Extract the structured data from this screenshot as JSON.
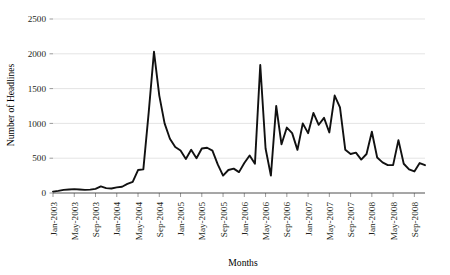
{
  "chart_data": {
    "type": "line",
    "title": "",
    "xlabel": "Months",
    "ylabel": "Number of Headlines",
    "ylim": [
      0,
      2500
    ],
    "yticks": [
      0,
      500,
      1000,
      1500,
      2000,
      2500
    ],
    "ytick_labels": [
      "0",
      "500",
      "1000",
      "1500",
      "2000",
      "2500"
    ],
    "grid": "horizontal",
    "legend": "none",
    "xtick_labels": [
      "Jan-2003",
      "May-2003",
      "Sep-2003",
      "Jan-2004",
      "May-2004",
      "Sep-2004",
      "Jan-2005",
      "May-2005",
      "Sep-2005",
      "Jan-2006",
      "May-2006",
      "Sep-2006",
      "Jan-2007",
      "May-2007",
      "Sep-2007",
      "Jan-2008",
      "May-2008",
      "Sep-2008"
    ],
    "xtick_interval_months": 4,
    "x": [
      "Jan-2003",
      "Feb-2003",
      "Mar-2003",
      "Apr-2003",
      "May-2003",
      "Jun-2003",
      "Jul-2003",
      "Aug-2003",
      "Sep-2003",
      "Oct-2003",
      "Nov-2003",
      "Dec-2003",
      "Jan-2004",
      "Feb-2004",
      "Mar-2004",
      "Apr-2004",
      "May-2004",
      "Jun-2004",
      "Jul-2004",
      "Aug-2004",
      "Sep-2004",
      "Oct-2004",
      "Nov-2004",
      "Dec-2004",
      "Jan-2005",
      "Feb-2005",
      "Mar-2005",
      "Apr-2005",
      "May-2005",
      "Jun-2005",
      "Jul-2005",
      "Aug-2005",
      "Sep-2005",
      "Oct-2005",
      "Nov-2005",
      "Dec-2005",
      "Jan-2006",
      "Feb-2006",
      "Mar-2006",
      "Apr-2006",
      "May-2006",
      "Jun-2006",
      "Jul-2006",
      "Aug-2006",
      "Sep-2006",
      "Oct-2006",
      "Nov-2006",
      "Dec-2006",
      "Jan-2007",
      "Feb-2007",
      "Mar-2007",
      "Apr-2007",
      "May-2007",
      "Jun-2007",
      "Jul-2007",
      "Aug-2007",
      "Sep-2007",
      "Oct-2007",
      "Nov-2007",
      "Dec-2007",
      "Jan-2008",
      "Feb-2008",
      "Mar-2008",
      "Apr-2008",
      "May-2008",
      "Jun-2008",
      "Jul-2008",
      "Aug-2008",
      "Sep-2008",
      "Oct-2008",
      "Nov-2008"
    ],
    "values": [
      20,
      30,
      45,
      50,
      55,
      50,
      45,
      48,
      60,
      95,
      70,
      65,
      80,
      90,
      130,
      160,
      330,
      340,
      1150,
      2030,
      1400,
      1000,
      780,
      660,
      610,
      490,
      620,
      500,
      640,
      650,
      610,
      410,
      250,
      330,
      350,
      300,
      430,
      540,
      420,
      1840,
      640,
      250,
      1250,
      700,
      940,
      860,
      620,
      1000,
      860,
      1150,
      980,
      1080,
      870,
      1400,
      1230,
      620,
      560,
      580,
      480,
      560,
      880,
      510,
      440,
      400,
      400,
      760,
      420,
      340,
      310,
      430,
      400
    ]
  }
}
